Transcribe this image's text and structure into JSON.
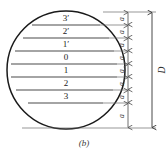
{
  "figure": {
    "caption": "(b)",
    "diameter_label": "D",
    "circle": {
      "cx": 66,
      "cy": 70,
      "r": 59
    },
    "levels": [
      {
        "label": "3′",
        "y": 25,
        "x1": 32,
        "x2": 100
      },
      {
        "label": "2′",
        "y": 38,
        "x1": 23,
        "x2": 109
      },
      {
        "label": "1′",
        "y": 51,
        "x1": 15,
        "x2": 114
      },
      {
        "label": "0",
        "y": 64,
        "x1": 11,
        "x2": 117
      },
      {
        "label": "1",
        "y": 77,
        "x1": 11,
        "x2": 117
      },
      {
        "label": "2",
        "y": 90,
        "x1": 16,
        "x2": 113
      },
      {
        "label": "3",
        "y": 103,
        "x1": 28,
        "x2": 103
      }
    ],
    "dimension_segments": [
      {
        "label": "a",
        "y_top": 12,
        "y_bottom": 25
      },
      {
        "label": "a",
        "y_top": 25,
        "y_bottom": 38
      },
      {
        "label": "a",
        "y_top": 38,
        "y_bottom": 51
      },
      {
        "label": "a",
        "y_top": 51,
        "y_bottom": 64
      },
      {
        "label": "a",
        "y_top": 64,
        "y_bottom": 77
      },
      {
        "label": "a",
        "y_top": 77,
        "y_bottom": 90
      },
      {
        "label": "a",
        "y_top": 90,
        "y_bottom": 103
      },
      {
        "label": "a",
        "y_top": 103,
        "y_bottom": 128
      }
    ],
    "dimension_line_x": 128,
    "diameter_line_x": 152,
    "extent_top_y": 12,
    "extent_bottom_y": 128,
    "colors": {
      "circle_stroke": "#1a1a1a",
      "chord_stroke": "#4a4a4a",
      "dimension_stroke": "#6a6a6a",
      "text": "#1a1a1a",
      "background": "#ffffff"
    }
  }
}
